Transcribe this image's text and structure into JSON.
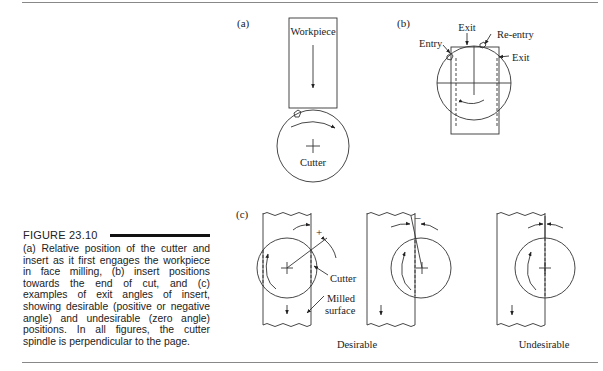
{
  "figure": {
    "number": "FIGURE 23.10",
    "caption": "(a) Relative position of the cutter and insert as it first engages the workpiece in face milling, (b) insert positions towards the end of cut, and (c) examples of exit angles of insert, showing desirable (positive or negative angle) and undesirable (zero angle) positions. In all figures, the cutter spindle is perpendicular to the page."
  },
  "panel_a": {
    "label": "(a)",
    "workpiece_label": "Workpiece",
    "cutter_label": "Cutter"
  },
  "panel_b": {
    "label": "(b)",
    "entry_label": "Entry",
    "exit_label_top": "Exit",
    "reentry_label": "Re-entry",
    "exit_label_right": "Exit"
  },
  "panel_c": {
    "label": "(c)",
    "cutter_label": "Cutter",
    "milled_label_line1": "Milled",
    "milled_label_line2": "surface",
    "plus_sign": "+",
    "minus_sign": "–",
    "desirable_label": "Desirable",
    "undesirable_label": "Undesirable"
  }
}
